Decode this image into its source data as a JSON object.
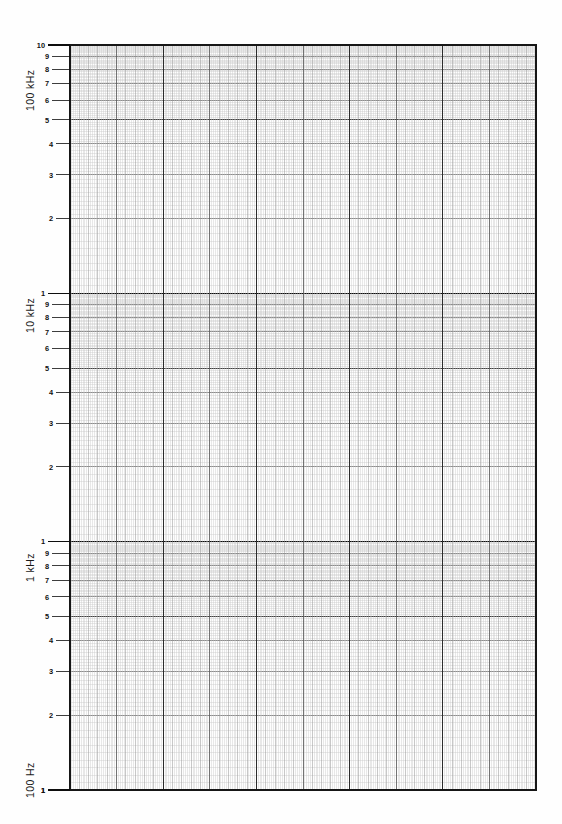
{
  "sheet": {
    "title": "Semi-logarithmic graph paper",
    "background_color": "#fefefe",
    "width": 562,
    "height": 824
  },
  "axis": {
    "decade_labels": [
      {
        "text": "100 kHz",
        "value": 100000,
        "at_tick": 1
      },
      {
        "text": "10 kHz",
        "value": 10000,
        "at_tick": 1
      },
      {
        "text": "1 kHz",
        "value": 1000,
        "at_tick": 1
      },
      {
        "text": "100 Hz",
        "value": 100,
        "at_tick": 1
      }
    ],
    "mantissa_ticks": [
      "10",
      "9",
      "8",
      "7",
      "6",
      "5",
      "4",
      "3",
      "2",
      "1"
    ],
    "top_tick_label": "10",
    "bottom_tick_label": "1",
    "unit_major": "kHz",
    "unit_minor": "Hz"
  },
  "chart_data": {
    "type": "line",
    "title": "",
    "subtitle": "",
    "xlabel": "",
    "ylabel": "",
    "grid": true,
    "legend_position": "none",
    "series": [],
    "x": {
      "scale": "linear",
      "xlim": [
        0,
        50
      ],
      "major_divisions": 5,
      "minor_per_major": 10,
      "tick_labels": []
    },
    "y": {
      "scale": "log",
      "ylim": [
        100,
        100000
      ],
      "decades": 3,
      "decade_boundaries": [
        100,
        1000,
        10000,
        100000
      ],
      "tick_labels": [
        "100 Hz",
        "200",
        "300",
        "400",
        "500",
        "600",
        "700",
        "800",
        "900",
        "1 kHz",
        "2",
        "3",
        "4",
        "5",
        "6",
        "7",
        "8",
        "9",
        "10 kHz",
        "20",
        "30",
        "40",
        "50",
        "60",
        "70",
        "80",
        "90",
        "100 kHz"
      ],
      "minor_per_decade": 9,
      "subminor_per_minor": 10
    },
    "plot_box": {
      "left": 70,
      "top": 45,
      "right": 536,
      "bottom": 790
    }
  },
  "grid_style": {
    "border_color": "#161616",
    "major_color": "#2c2c2c",
    "medium_color": "#5c5c5c",
    "minor_color": "#9a9a9a",
    "subminor_color": "#c9c9c9",
    "decade_color": "#0d0d0d"
  }
}
